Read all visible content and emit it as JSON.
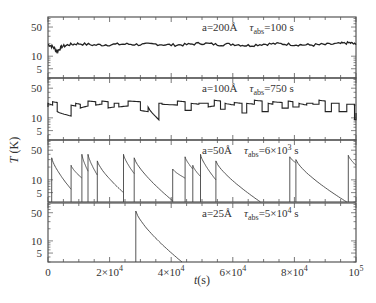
{
  "chart_data": {
    "type": "line",
    "layout": "4 vertically stacked panels sharing x-axis, log-scale y",
    "xlabel": "t(s)",
    "ylabel": "T (K)",
    "xlim": [
      0,
      100000
    ],
    "x_ticks": [
      0,
      20000,
      40000,
      60000,
      80000,
      100000
    ],
    "x_tick_labels": [
      "0",
      "2×10^4",
      "4×10^4",
      "6×10^4",
      "8×10^4",
      "10^5"
    ],
    "y_scale": "log",
    "ylim": [
      3,
      87
    ],
    "y_ticks": [
      5,
      10,
      50
    ],
    "y_tick_labels": [
      "5",
      "10",
      "50"
    ],
    "grid": false,
    "panels": [
      {
        "label_a": "a=200Å",
        "label_tau": "τ",
        "label_tau_sub": "abs",
        "label_tau_val": "=100 s",
        "style": "noisy",
        "series": [
          {
            "t": 0,
            "T": 19
          },
          {
            "t": 1500,
            "T": 17
          },
          {
            "t": 3000,
            "T": 13
          },
          {
            "t": 4500,
            "T": 17
          },
          {
            "t": 7000,
            "T": 19
          },
          {
            "t": 10000,
            "T": 20
          },
          {
            "t": 15000,
            "T": 18.5
          },
          {
            "t": 20000,
            "T": 19
          },
          {
            "t": 25000,
            "T": 19.5
          },
          {
            "t": 30000,
            "T": 19
          },
          {
            "t": 35000,
            "T": 19.5
          },
          {
            "t": 40000,
            "T": 18.5
          },
          {
            "t": 45000,
            "T": 19
          },
          {
            "t": 50000,
            "T": 20.5
          },
          {
            "t": 55000,
            "T": 19
          },
          {
            "t": 60000,
            "T": 19.5
          },
          {
            "t": 65000,
            "T": 18
          },
          {
            "t": 70000,
            "T": 19.5
          },
          {
            "t": 75000,
            "T": 20
          },
          {
            "t": 80000,
            "T": 19
          },
          {
            "t": 85000,
            "T": 18.5
          },
          {
            "t": 90000,
            "T": 19
          },
          {
            "t": 95000,
            "T": 20
          },
          {
            "t": 98000,
            "T": 21
          },
          {
            "t": 100000,
            "T": 19
          }
        ]
      },
      {
        "label_a": "a=100Å",
        "label_tau": "τ",
        "label_tau_sub": "abs",
        "label_tau_val": "=750 s",
        "style": "sawtooth",
        "spikes": [
          [
            0,
            18,
            22
          ],
          [
            1500,
            20,
            24
          ],
          [
            3000,
            23,
            14
          ],
          [
            7500,
            11,
            20
          ],
          [
            9000,
            19,
            22
          ],
          [
            10500,
            21,
            17
          ],
          [
            13000,
            19,
            25
          ],
          [
            15500,
            24,
            20
          ],
          [
            17500,
            21,
            25
          ],
          [
            19500,
            24,
            17
          ],
          [
            21500,
            18,
            22
          ],
          [
            23000,
            22,
            18
          ],
          [
            26000,
            19,
            25
          ],
          [
            30000,
            24,
            15
          ],
          [
            32500,
            14,
            18
          ],
          [
            36000,
            9,
            22
          ],
          [
            37000,
            22,
            21
          ],
          [
            42000,
            20,
            25
          ],
          [
            44500,
            24,
            15
          ],
          [
            46500,
            15,
            22
          ],
          [
            49000,
            21,
            22
          ],
          [
            52000,
            22,
            18
          ],
          [
            54000,
            19,
            26
          ],
          [
            56000,
            25,
            16
          ],
          [
            57500,
            16,
            22
          ],
          [
            60500,
            20,
            23
          ],
          [
            63000,
            22,
            13
          ],
          [
            64500,
            13,
            22
          ],
          [
            67000,
            21,
            26
          ],
          [
            69500,
            25,
            14
          ],
          [
            71500,
            14,
            22
          ],
          [
            73000,
            21,
            24
          ],
          [
            76000,
            23,
            17
          ],
          [
            78000,
            17,
            25
          ],
          [
            79500,
            24,
            18
          ],
          [
            81500,
            18,
            22
          ],
          [
            84000,
            20,
            22
          ],
          [
            86000,
            22,
            21
          ],
          [
            88000,
            21,
            26
          ],
          [
            90000,
            25,
            14
          ],
          [
            92000,
            14,
            22
          ],
          [
            94500,
            22,
            14
          ],
          [
            97000,
            14,
            21
          ],
          [
            99500,
            21,
            9
          ],
          [
            100000,
            9,
            13
          ]
        ]
      },
      {
        "label_a": "a=50Å",
        "label_tau": "τ",
        "label_tau_sub": "abs",
        "label_tau_val": "=6×10",
        "label_tau_exp": "3",
        "label_tau_unit": " s",
        "style": "decay",
        "events": [
          {
            "t_start": 1200,
            "T_peak": 33,
            "t_end": 7500,
            "T_end": 6
          },
          {
            "t_start": 7500,
            "T_peak": 22,
            "t_end": 11000,
            "T_end": 11
          },
          {
            "t_start": 11000,
            "T_peak": 40,
            "t_end": 13000,
            "T_end": 16
          },
          {
            "t_start": 13000,
            "T_peak": 40,
            "t_end": 16000,
            "T_end": 13
          },
          {
            "t_start": 16000,
            "T_peak": 28,
            "t_end": 24500,
            "T_end": 5
          },
          {
            "t_start": 24500,
            "T_peak": 40,
            "t_end": 28000,
            "T_end": 14
          },
          {
            "t_start": 28000,
            "T_peak": 33,
            "t_end": 40500,
            "T_end": 3.2
          },
          {
            "t_start": 40500,
            "T_peak": 18,
            "t_end": 44500,
            "T_end": 11
          },
          {
            "t_start": 44500,
            "T_peak": 35,
            "t_end": 47000,
            "T_end": 18
          },
          {
            "t_start": 47000,
            "T_peak": 22,
            "t_end": 49500,
            "T_end": 12
          },
          {
            "t_start": 49500,
            "T_peak": 40,
            "t_end": 54500,
            "T_end": 10
          },
          {
            "t_start": 54500,
            "T_peak": 28,
            "t_end": 69000,
            "T_end": 3
          },
          {
            "t_start": 78500,
            "T_peak": 35,
            "t_end": 80500,
            "T_end": 25
          },
          {
            "t_start": 80500,
            "T_peak": 30,
            "t_end": 97000,
            "T_end": 3
          },
          {
            "t_start": 97500,
            "T_peak": 38,
            "t_end": 100000,
            "T_end": 22
          }
        ]
      },
      {
        "label_a": "a=25Å",
        "label_tau": "τ",
        "label_tau_sub": "abs",
        "label_tau_val": "=5×10",
        "label_tau_exp": "4",
        "label_tau_unit": " s",
        "style": "decay",
        "events": [
          {
            "t_start": 28500,
            "T_peak": 55,
            "t_end": 43500,
            "T_end": 3
          }
        ]
      }
    ]
  },
  "axis": {
    "ylabel_T": "T",
    "ylabel_unit": " (K)",
    "xlabel_t": "t",
    "xlabel_unit": "(s)",
    "x_tick_text": [
      "0",
      "2×10",
      "4×10",
      "6×10",
      "8×10",
      "10"
    ],
    "x_tick_exp": [
      "",
      "4",
      "4",
      "4",
      "4",
      "5"
    ],
    "y_tick_text": [
      "50",
      "10",
      "5"
    ]
  }
}
